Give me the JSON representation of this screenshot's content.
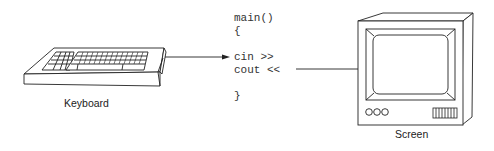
{
  "diagram": {
    "keyboard": {
      "label": "Keyboard"
    },
    "screen": {
      "label": "Screen"
    },
    "code": {
      "lines": [
        "main()",
        "{",
        "cin >>",
        "cout <<",
        "}"
      ]
    },
    "arrows": [
      {
        "from": "keyboard",
        "to": "cin >>"
      },
      {
        "from": "cout <<",
        "to": "screen"
      }
    ],
    "colors": {
      "stroke": "#222222",
      "background": "#ffffff"
    }
  }
}
